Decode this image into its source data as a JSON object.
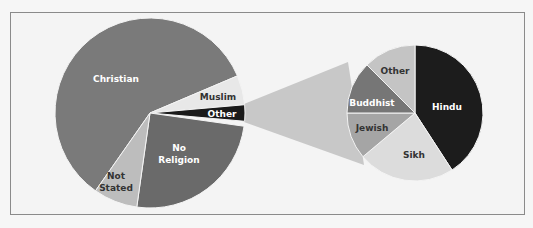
{
  "chart_data": {
    "type": "pie",
    "title": "",
    "layout": "pie-of-pie",
    "main_pie": {
      "slices": [
        {
          "label": "Christian",
          "value": 59.3,
          "color": "#7a7a7a",
          "text_color": "#ffffff"
        },
        {
          "label": "Muslim",
          "value": 4.8,
          "color": "#e8e8e8",
          "text_color": "#333333"
        },
        {
          "label": "Other",
          "value": 2.7,
          "color": "#1a1a1a",
          "text_color": "#ffffff"
        },
        {
          "label": "No Religion",
          "value": 25.6,
          "color": "#6a6a6a",
          "text_color": "#ffffff"
        },
        {
          "label": "Not Stated",
          "value": 7.6,
          "color": "#bdbdbd",
          "text_color": "#333333"
        }
      ]
    },
    "secondary_pie": {
      "explodes": "Other",
      "slices": [
        {
          "label": "Hindu",
          "value": 41,
          "color": "#1c1c1c",
          "text_color": "#ffffff"
        },
        {
          "label": "Sikh",
          "value": 23,
          "color": "#dcdcdc",
          "text_color": "#333333"
        },
        {
          "label": "Jewish",
          "value": 11,
          "color": "#a5a5a5",
          "text_color": "#333333"
        },
        {
          "label": "Buddhist",
          "value": 12.5,
          "color": "#767676",
          "text_color": "#ffffff"
        },
        {
          "label": "Other",
          "value": 12.5,
          "color": "#c4c4c4",
          "text_color": "#333333"
        }
      ]
    },
    "connector_color": "#c8c8c8",
    "legend": "none",
    "grid": false
  }
}
